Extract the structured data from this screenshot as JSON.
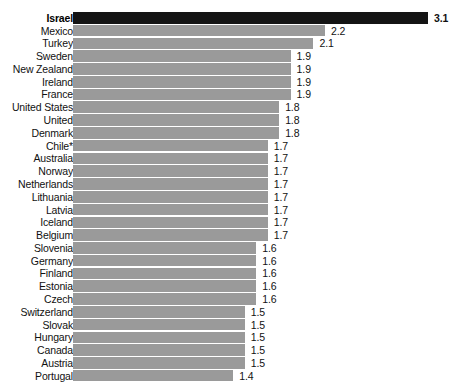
{
  "chart_data": {
    "type": "bar",
    "orientation": "horizontal",
    "title": "",
    "subtitle": "",
    "xlabel": "",
    "ylabel": "",
    "grid": false,
    "legend": null,
    "xlim": [
      0,
      3.1
    ],
    "highlight_category": "Israel",
    "highlight_color": "#141414",
    "bar_color": "#9a9a9a",
    "categories": [
      "Israel",
      "Mexico",
      "Turkey",
      "Sweden",
      "New Zealand",
      "Ireland",
      "France",
      "United States",
      "United",
      "Denmark",
      "Chile*",
      "Australia",
      "Norway",
      "Netherlands",
      "Lithuania",
      "Latvia",
      "Iceland",
      "Belgium",
      "Slovenia",
      "Germany",
      "Finland",
      "Estonia",
      "Czech",
      "Switzerland",
      "Slovak",
      "Hungary",
      "Canada",
      "Austria",
      "Portugal"
    ],
    "values": [
      3.1,
      2.2,
      2.1,
      1.9,
      1.9,
      1.9,
      1.9,
      1.8,
      1.8,
      1.8,
      1.7,
      1.7,
      1.7,
      1.7,
      1.7,
      1.7,
      1.7,
      1.7,
      1.6,
      1.6,
      1.6,
      1.6,
      1.6,
      1.5,
      1.5,
      1.5,
      1.5,
      1.5,
      1.4
    ],
    "value_labels": [
      "3.1",
      "2.2",
      "2.1",
      "1.9",
      "1.9",
      "1.9",
      "1.9",
      "1.8",
      "1.8",
      "1.8",
      "1.7",
      "1.7",
      "1.7",
      "1.7",
      "1.7",
      "1.7",
      "1.7",
      "1.7",
      "1.6",
      "1.6",
      "1.6",
      "1.6",
      "1.6",
      "1.5",
      "1.5",
      "1.5",
      "1.5",
      "1.5",
      "1.4"
    ]
  }
}
